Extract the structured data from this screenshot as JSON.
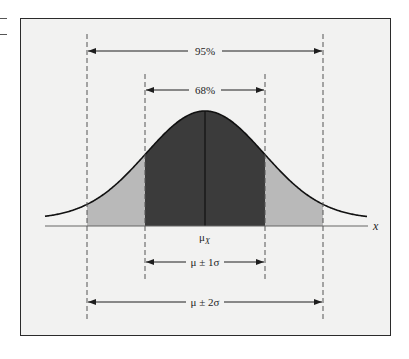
{
  "figure": {
    "axis_variable": "x",
    "mean_label": "μ",
    "mean_subscript": "X",
    "bands": [
      {
        "id": "inner",
        "percent_label": "68%",
        "range_label": "μ ± 1σ",
        "sigma": 1
      },
      {
        "id": "outer",
        "percent_label": "95%",
        "range_label": "μ ± 2σ",
        "sigma": 2
      }
    ],
    "colors": {
      "frame_background": "#f2f2f1",
      "inner_fill": "#3b3b3b",
      "outer_fill": "#b9b9b9",
      "curve": "#111111",
      "dashed_lines": "#555555"
    }
  }
}
